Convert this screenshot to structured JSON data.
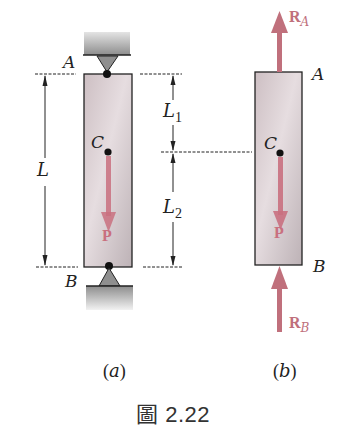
{
  "figure": {
    "caption_prefix": "圖",
    "caption_number": "2.22",
    "caption": "圖 2.22",
    "subfigures": [
      {
        "id": "a",
        "label": "(a)"
      },
      {
        "id": "b",
        "label": "(b)"
      }
    ]
  },
  "labels": {
    "point_a": "A",
    "point_b": "B",
    "point_c": "C",
    "length_total": "L",
    "length_1_main": "L",
    "length_1_sub": "1",
    "length_2_main": "L",
    "length_2_sub": "2",
    "load": "P",
    "reaction_a_main": "R",
    "reaction_a_sub": "A",
    "reaction_b_main": "R",
    "reaction_b_sub": "B"
  },
  "colors": {
    "force_arrow": "#c9707f",
    "bar_fill": "#d9ced1",
    "support_gray": "#a9a9a9",
    "line": "#222222"
  }
}
